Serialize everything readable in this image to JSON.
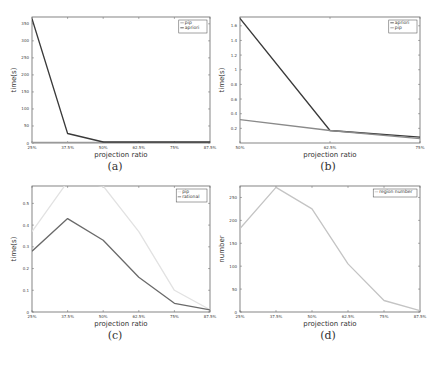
{
  "chart_data": [
    {
      "id": "a",
      "type": "line",
      "caption": "(a)",
      "title": "",
      "xlabel": "projection ratio",
      "ylabel": "time(s)",
      "categories": [
        "25%",
        "37.5%",
        "50%",
        "62.5%",
        "75%",
        "87.5%"
      ],
      "yticks": [
        0,
        50,
        100,
        150,
        200,
        250,
        300,
        350
      ],
      "ylim": [
        0,
        370
      ],
      "grid": false,
      "legend_position": "upper right",
      "series": [
        {
          "name": "pip",
          "color": "#9a9a9a",
          "values": [
            2,
            2,
            2,
            2,
            2,
            2
          ]
        },
        {
          "name": "apriori",
          "color": "#3a3a3a",
          "values": [
            365,
            28,
            3,
            3,
            3,
            3
          ]
        }
      ]
    },
    {
      "id": "b",
      "type": "line",
      "caption": "(b)",
      "title": "",
      "xlabel": "projection ratio",
      "ylabel": "time(s)",
      "categories": [
        "50%",
        "62.5%",
        "75%"
      ],
      "yticks": [
        0.2,
        0.4,
        0.6,
        0.8,
        1,
        1.2,
        1.4,
        1.6
      ],
      "ylim": [
        0,
        1.72
      ],
      "grid": false,
      "legend_position": "upper right",
      "series": [
        {
          "name": "apriori",
          "color": "#3a3a3a",
          "values": [
            1.7,
            0.17,
            0.08
          ]
        },
        {
          "name": "pip",
          "color": "#8a8a8a",
          "values": [
            0.32,
            0.17,
            0.06
          ]
        }
      ]
    },
    {
      "id": "c",
      "type": "line",
      "caption": "(c)",
      "title": "",
      "xlabel": "projection ratio",
      "ylabel": "time(s)",
      "categories": [
        "25%",
        "37.5%",
        "50%",
        "62.5%",
        "75%",
        "87.5%"
      ],
      "yticks": [
        0,
        0.1,
        0.2,
        0.3,
        0.4,
        0.5
      ],
      "ylim": [
        0,
        0.58
      ],
      "grid": false,
      "legend_position": "upper right",
      "series": [
        {
          "name": "pip",
          "color": "#e2e2e2",
          "values": [
            0.37,
            0.6,
            0.58,
            0.37,
            0.1,
            0.01
          ]
        },
        {
          "name": "rational",
          "color": "#6a6a6a",
          "values": [
            0.28,
            0.43,
            0.33,
            0.16,
            0.04,
            0.01
          ]
        }
      ]
    },
    {
      "id": "d",
      "type": "line",
      "caption": "(d)",
      "title": "",
      "xlabel": "projection ratio",
      "ylabel": "number",
      "categories": [
        "25%",
        "37.5%",
        "50%",
        "62.5%",
        "75%",
        "87.5%"
      ],
      "yticks": [
        0,
        50,
        100,
        150,
        200,
        250
      ],
      "ylim": [
        0,
        275
      ],
      "grid": false,
      "legend_position": "upper right",
      "series": [
        {
          "name": "region number",
          "color": "#c4c4c4",
          "values": [
            182,
            272,
            225,
            105,
            25,
            3
          ]
        }
      ]
    }
  ],
  "captions": {
    "a": "(a)",
    "b": "(b)",
    "c": "(c)",
    "d": "(d)"
  }
}
